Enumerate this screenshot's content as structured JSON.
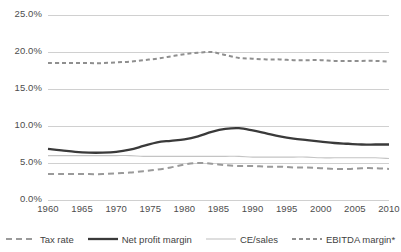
{
  "chart_data": {
    "type": "line",
    "title": "",
    "xlabel": "",
    "ylabel": "",
    "xlim": [
      1960,
      2010
    ],
    "ylim": [
      0,
      25
    ],
    "grid": true,
    "y_tick_labels": [
      "0.0%",
      "5.0%",
      "10.0%",
      "15.0%",
      "20.0%",
      "25.0%"
    ],
    "y_tick_values": [
      0,
      5,
      10,
      15,
      20,
      25
    ],
    "x_tick_labels": [
      "1960",
      "1965",
      "1970",
      "1975",
      "1980",
      "1985",
      "1990",
      "1995",
      "2000",
      "2005",
      "2010"
    ],
    "x_tick_values": [
      1960,
      1965,
      1970,
      1975,
      1980,
      1985,
      1990,
      1995,
      2000,
      2005,
      2010
    ],
    "legend_position": "bottom",
    "x": [
      1960,
      1962,
      1964,
      1966,
      1968,
      1970,
      1972,
      1974,
      1976,
      1978,
      1980,
      1982,
      1984,
      1986,
      1988,
      1990,
      1992,
      1994,
      1996,
      1998,
      2000,
      2002,
      2004,
      2006,
      2008,
      2010
    ],
    "series": [
      {
        "name": "Tax rate",
        "style": "dashed",
        "color": "#9a9a9a",
        "width": 2.0,
        "dash": "6,4",
        "values": [
          3.5,
          3.5,
          3.5,
          3.5,
          3.5,
          3.6,
          3.7,
          3.9,
          4.1,
          4.4,
          4.8,
          5.0,
          4.9,
          4.7,
          4.6,
          4.6,
          4.5,
          4.5,
          4.4,
          4.4,
          4.3,
          4.2,
          4.2,
          4.3,
          4.3,
          4.2
        ]
      },
      {
        "name": "Net profit margin",
        "style": "solid",
        "color": "#3a3a3a",
        "width": 2.3,
        "dash": "",
        "values": [
          6.9,
          6.7,
          6.5,
          6.4,
          6.4,
          6.5,
          6.8,
          7.3,
          7.8,
          8.0,
          8.2,
          8.6,
          9.2,
          9.6,
          9.7,
          9.4,
          9.0,
          8.6,
          8.3,
          8.1,
          7.9,
          7.7,
          7.6,
          7.5,
          7.5,
          7.5
        ]
      },
      {
        "name": "CE/sales",
        "style": "solid",
        "color": "#c4c4c4",
        "width": 1.1,
        "dash": "",
        "values": [
          6.0,
          6.0,
          6.0,
          6.0,
          6.0,
          6.0,
          6.0,
          5.9,
          5.9,
          5.9,
          5.9,
          5.9,
          5.9,
          5.9,
          5.9,
          5.8,
          5.8,
          5.8,
          5.8,
          5.8,
          5.7,
          5.7,
          5.7,
          5.7,
          5.7,
          5.6
        ]
      },
      {
        "name": "EBITDA margin*",
        "style": "dashed",
        "color": "#8f8f8f",
        "width": 2.0,
        "dash": "4,3",
        "values": [
          18.5,
          18.5,
          18.5,
          18.5,
          18.5,
          18.6,
          18.7,
          18.9,
          19.1,
          19.4,
          19.7,
          19.9,
          20.0,
          19.6,
          19.2,
          19.1,
          19.0,
          19.0,
          18.9,
          18.9,
          18.9,
          18.8,
          18.8,
          18.8,
          18.8,
          18.7
        ]
      }
    ]
  },
  "legend": {
    "items": [
      {
        "label": "Tax rate"
      },
      {
        "label": "Net profit margin"
      },
      {
        "label": "CE/sales"
      },
      {
        "label": "EBITDA margin*"
      }
    ]
  },
  "colors": {
    "gridline": "#d0d0d0",
    "axis_text": "#4d4d4d",
    "background": "#ffffff"
  }
}
